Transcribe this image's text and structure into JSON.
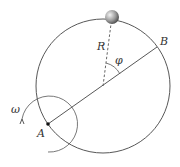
{
  "diagram": {
    "labels": {
      "A": "A",
      "B": "B",
      "R": "R",
      "phi": "φ",
      "omega": "ω"
    },
    "colors": {
      "line": "#444444",
      "ball_light": "#eeeeee",
      "ball_dark": "#555555"
    }
  }
}
